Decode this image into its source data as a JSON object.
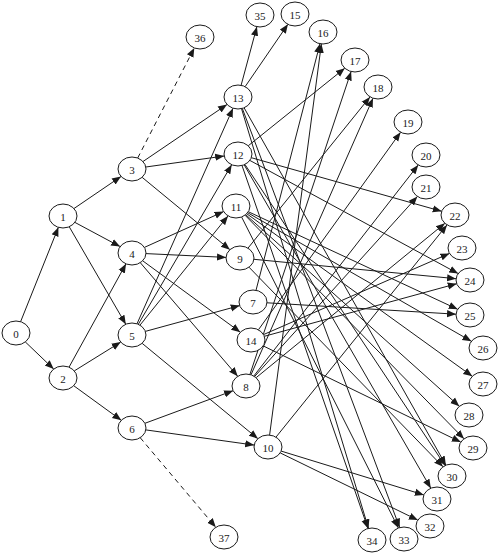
{
  "diagram": {
    "type": "directed-graph",
    "node_rx": 14,
    "node_ry": 12,
    "stroke_color": "#1a1a1a",
    "background": "#ffffff",
    "nodes": [
      {
        "id": "0",
        "x": 16,
        "y": 333
      },
      {
        "id": "1",
        "x": 63,
        "y": 216
      },
      {
        "id": "2",
        "x": 63,
        "y": 378
      },
      {
        "id": "3",
        "x": 132,
        "y": 169
      },
      {
        "id": "4",
        "x": 132,
        "y": 253
      },
      {
        "id": "5",
        "x": 132,
        "y": 335
      },
      {
        "id": "6",
        "x": 132,
        "y": 428
      },
      {
        "id": "7",
        "x": 253,
        "y": 302
      },
      {
        "id": "8",
        "x": 246,
        "y": 386
      },
      {
        "id": "9",
        "x": 240,
        "y": 258
      },
      {
        "id": "10",
        "x": 268,
        "y": 447
      },
      {
        "id": "11",
        "x": 236,
        "y": 206
      },
      {
        "id": "12",
        "x": 238,
        "y": 154
      },
      {
        "id": "13",
        "x": 238,
        "y": 97
      },
      {
        "id": "14",
        "x": 251,
        "y": 340
      },
      {
        "id": "15",
        "x": 295,
        "y": 14
      },
      {
        "id": "16",
        "x": 323,
        "y": 32
      },
      {
        "id": "17",
        "x": 355,
        "y": 60
      },
      {
        "id": "18",
        "x": 378,
        "y": 87
      },
      {
        "id": "19",
        "x": 408,
        "y": 122
      },
      {
        "id": "20",
        "x": 426,
        "y": 155
      },
      {
        "id": "21",
        "x": 426,
        "y": 187
      },
      {
        "id": "22",
        "x": 455,
        "y": 215
      },
      {
        "id": "23",
        "x": 462,
        "y": 248
      },
      {
        "id": "24",
        "x": 470,
        "y": 280
      },
      {
        "id": "25",
        "x": 470,
        "y": 315
      },
      {
        "id": "26",
        "x": 483,
        "y": 348
      },
      {
        "id": "27",
        "x": 483,
        "y": 384
      },
      {
        "id": "28",
        "x": 469,
        "y": 415
      },
      {
        "id": "29",
        "x": 473,
        "y": 448
      },
      {
        "id": "30",
        "x": 452,
        "y": 476
      },
      {
        "id": "31",
        "x": 437,
        "y": 499
      },
      {
        "id": "32",
        "x": 430,
        "y": 526
      },
      {
        "id": "33",
        "x": 404,
        "y": 539
      },
      {
        "id": "34",
        "x": 372,
        "y": 540
      },
      {
        "id": "35",
        "x": 260,
        "y": 15
      },
      {
        "id": "36",
        "x": 200,
        "y": 37
      },
      {
        "id": "37",
        "x": 224,
        "y": 537
      }
    ],
    "edges": [
      {
        "from": "0",
        "to": "1"
      },
      {
        "from": "0",
        "to": "2"
      },
      {
        "from": "1",
        "to": "3"
      },
      {
        "from": "1",
        "to": "4"
      },
      {
        "from": "1",
        "to": "5"
      },
      {
        "from": "2",
        "to": "4"
      },
      {
        "from": "2",
        "to": "5"
      },
      {
        "from": "2",
        "to": "6"
      },
      {
        "from": "3",
        "to": "13"
      },
      {
        "from": "3",
        "to": "12"
      },
      {
        "from": "3",
        "to": "9"
      },
      {
        "from": "3",
        "to": "36",
        "dashed": true
      },
      {
        "from": "4",
        "to": "11"
      },
      {
        "from": "4",
        "to": "9"
      },
      {
        "from": "4",
        "to": "14"
      },
      {
        "from": "4",
        "to": "8"
      },
      {
        "from": "5",
        "to": "13"
      },
      {
        "from": "5",
        "to": "12"
      },
      {
        "from": "5",
        "to": "11"
      },
      {
        "from": "5",
        "to": "7"
      },
      {
        "from": "5",
        "to": "10"
      },
      {
        "from": "6",
        "to": "8"
      },
      {
        "from": "6",
        "to": "10"
      },
      {
        "from": "6",
        "to": "37",
        "dashed": true
      },
      {
        "from": "13",
        "to": "35"
      },
      {
        "from": "13",
        "to": "15"
      },
      {
        "from": "13",
        "to": "30"
      },
      {
        "from": "13",
        "to": "33"
      },
      {
        "from": "13",
        "to": "34"
      },
      {
        "from": "12",
        "to": "17"
      },
      {
        "from": "12",
        "to": "22"
      },
      {
        "from": "12",
        "to": "24"
      },
      {
        "from": "12",
        "to": "30"
      },
      {
        "from": "12",
        "to": "31"
      },
      {
        "from": "12",
        "to": "34"
      },
      {
        "from": "11",
        "to": "25"
      },
      {
        "from": "11",
        "to": "26"
      },
      {
        "from": "11",
        "to": "27"
      },
      {
        "from": "11",
        "to": "28"
      },
      {
        "from": "11",
        "to": "29"
      },
      {
        "from": "11",
        "to": "33"
      },
      {
        "from": "9",
        "to": "18"
      },
      {
        "from": "9",
        "to": "24"
      },
      {
        "from": "9",
        "to": "30"
      },
      {
        "from": "7",
        "to": "16"
      },
      {
        "from": "7",
        "to": "25"
      },
      {
        "from": "14",
        "to": "19"
      },
      {
        "from": "14",
        "to": "23"
      },
      {
        "from": "14",
        "to": "24"
      },
      {
        "from": "14",
        "to": "29"
      },
      {
        "from": "8",
        "to": "17"
      },
      {
        "from": "8",
        "to": "18"
      },
      {
        "from": "8",
        "to": "20"
      },
      {
        "from": "8",
        "to": "21"
      },
      {
        "from": "8",
        "to": "22"
      },
      {
        "from": "10",
        "to": "16"
      },
      {
        "from": "10",
        "to": "22"
      },
      {
        "from": "10",
        "to": "31"
      },
      {
        "from": "10",
        "to": "32"
      }
    ]
  }
}
